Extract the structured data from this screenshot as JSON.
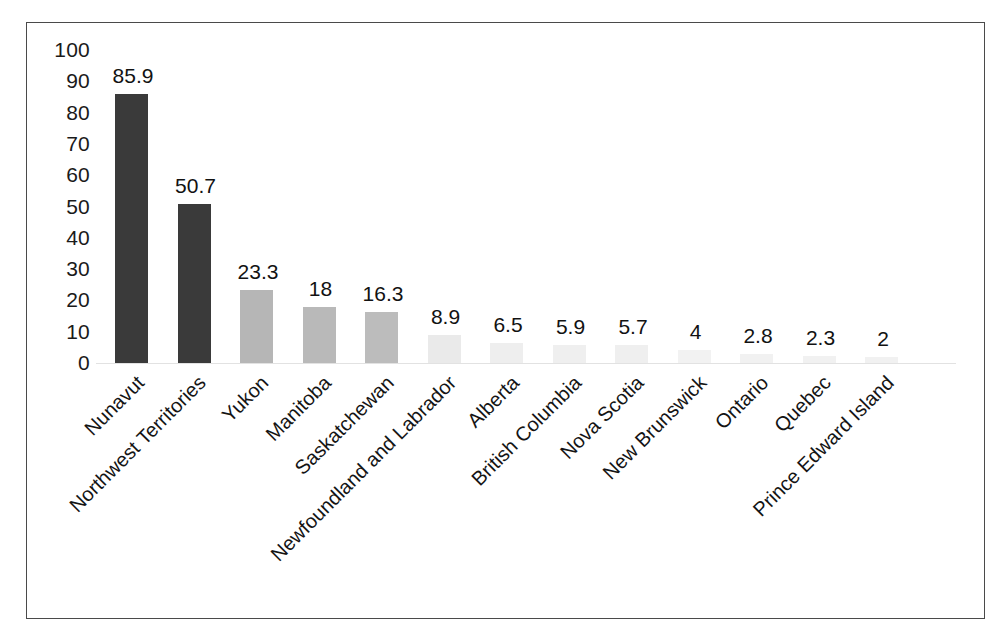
{
  "chart_data": {
    "type": "bar",
    "title": "",
    "subtitle": "",
    "xlabel": "",
    "ylabel": "",
    "ylim": [
      0,
      100
    ],
    "yticks": [
      100,
      90,
      80,
      70,
      60,
      50,
      40,
      30,
      20,
      10,
      0
    ],
    "grid": false,
    "legend": false,
    "orientation": "vertical",
    "value_labels_shown": true,
    "xtick_rotation": 45,
    "categories": [
      "Nunavut",
      "Northwest Territories",
      "Yukon",
      "Manitoba",
      "Saskatchewan",
      "Newfoundland and Labrador",
      "Alberta",
      "British Columbia",
      "Nova Scotia",
      "New Brunswick",
      "Ontario",
      "Quebec",
      "Prince Edward Island"
    ],
    "values": [
      85.9,
      50.7,
      23.3,
      18,
      16.3,
      8.9,
      6.5,
      5.9,
      5.7,
      4,
      2.8,
      2.3,
      2
    ],
    "value_label_text": [
      "85.9",
      "50.7",
      "23.3",
      "18",
      "16.3",
      "8.9",
      "6.5",
      "5.9",
      "5.7",
      "4",
      "2.8",
      "2.3",
      "2"
    ],
    "bar_colors": [
      "#3a3a3a",
      "#3a3a3a",
      "#b6b6b6",
      "#b9b9b9",
      "#bcbcbc",
      "#eaeaea",
      "#eeeeee",
      "#efefef",
      "#efefef",
      "#f2f2f2",
      "#f1f1f1",
      "#f1f1f1",
      "#f1f1f1"
    ]
  },
  "colors": {
    "background": "#ffffff",
    "frame_border": "#4a4a4a",
    "tick_text": "#1a1a1a",
    "value_text": "#121212",
    "baseline": "#e2e2e2",
    "dark_bar": "#3a3a3a",
    "light_bar": "#b8b8b8"
  }
}
